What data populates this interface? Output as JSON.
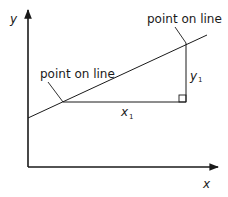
{
  "diagram": {
    "axes": {
      "x_label": "x",
      "y_label": "y"
    },
    "line": {
      "start": [
        28,
        118
      ],
      "end": [
        207,
        35
      ]
    },
    "points": [
      {
        "label": "point on line",
        "x": 63,
        "y": 102,
        "label_x": 42,
        "label_y": 76
      },
      {
        "label": "point on line",
        "x": 186,
        "y": 43,
        "label_x": 148,
        "label_y": 22
      }
    ],
    "run": {
      "label": "x",
      "subscript": "1"
    },
    "rise": {
      "label": "y",
      "subscript": "1"
    },
    "colors": {
      "stroke": "#1a1a1a",
      "background": "#ffffff"
    }
  }
}
